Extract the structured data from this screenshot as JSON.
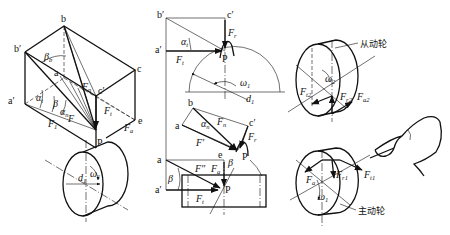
{
  "figure": {
    "panels": [
      {
        "id": "a",
        "name": "3D force decomposition box",
        "points": [
          "b",
          "b'",
          "a",
          "a'",
          "c",
          "c'",
          "e",
          "P"
        ],
        "angles": [
          "βb",
          "αt",
          "β",
          "αn"
        ],
        "forces": [
          "Fn",
          "Ft",
          "Fa",
          "F1",
          "F"
        ],
        "gear_labels": [
          "d1",
          "ω1"
        ]
      },
      {
        "id": "b",
        "name": "Planar projections",
        "top": {
          "points": [
            "b'",
            "c'",
            "a'",
            "P"
          ],
          "forces": [
            "Fr",
            "Ft"
          ],
          "angle": "αt",
          "labels": [
            "ω1",
            "d1"
          ]
        },
        "middle": {
          "points": [
            "b",
            "a",
            "c'",
            "P"
          ],
          "forces": [
            "Fn",
            "F'",
            "Fr"
          ],
          "angle": "αn"
        },
        "bottom": {
          "points": [
            "a",
            "a'",
            "e",
            "P"
          ],
          "forces": [
            "F''",
            "Fa",
            "Ft"
          ],
          "angle": "β"
        }
      },
      {
        "id": "c",
        "name": "Driven and driving gear force directions",
        "driven": {
          "label": "从动轮",
          "forces": [
            "Ft2",
            "Fr2",
            "Fa2"
          ],
          "omega": "ω2"
        },
        "driving": {
          "label": "主动轮",
          "forces": [
            "Fa1",
            "Fr1",
            "Ft1"
          ],
          "omega": "ω1"
        }
      }
    ]
  },
  "labels": {
    "b": "b",
    "b_prime": "b′",
    "a": "a",
    "a_prime": "a′",
    "c": "c",
    "c_prime": "c′",
    "e": "e",
    "P": "P",
    "F": "F",
    "Fsub_n": "n",
    "Fsub_t": "t",
    "Fsub_a": "a",
    "Fsub_r": "r",
    "Fsub_1": "1",
    "beta": "β",
    "beta_b_sub": "b",
    "alpha": "α",
    "alpha_t_sub": "t",
    "alpha_n_sub": "n",
    "omega": "ω",
    "d": "d",
    "one": "1",
    "two": "2",
    "F_prime": "F′",
    "F_dprime": "F″",
    "Ft2_sub": "t2",
    "Fr2_sub": "r2",
    "Fa2_sub": "a2",
    "Fa1_sub": "a",
    "Fr1_sub": "r1",
    "Ft1_sub": "t1",
    "driven_gear": "从动轮",
    "driving_gear": "主动轮"
  }
}
